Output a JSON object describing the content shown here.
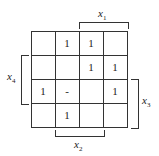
{
  "kmap": {
    "variables": [
      "x1",
      "x2",
      "x3",
      "x4"
    ],
    "labels": {
      "x1": "x",
      "x1_sub": "1",
      "x2": "x",
      "x2_sub": "2",
      "x3": "x",
      "x3_sub": "3",
      "x4": "x",
      "x4_sub": "4"
    },
    "cells": [
      [
        "",
        "1",
        "1",
        ""
      ],
      [
        "",
        "",
        "1",
        "1"
      ],
      [
        "1",
        "-",
        "",
        "1"
      ],
      [
        "",
        "1",
        "",
        ""
      ]
    ]
  }
}
